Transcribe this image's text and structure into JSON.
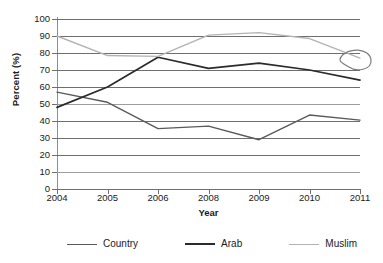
{
  "chart_data": {
    "type": "line",
    "title": "",
    "xlabel": "Year",
    "ylabel": "Percent (%)",
    "categories": [
      "2004",
      "2005",
      "2006",
      "2008",
      "2009",
      "2010",
      "2011"
    ],
    "ylim": [
      0,
      100
    ],
    "ytick_step": 10,
    "yticks": [
      "100",
      "90",
      "80",
      "70",
      "60",
      "50",
      "40",
      "30",
      "20",
      "10",
      "0"
    ],
    "grid": true,
    "legend_position": "bottom",
    "series": [
      {
        "name": "Country",
        "color": "#5a5a5a",
        "values": [
          57,
          51,
          35.5,
          37,
          29,
          43.5,
          40.5
        ]
      },
      {
        "name": "Arab",
        "color": "#2b2b2b",
        "values": [
          48,
          60,
          77.5,
          71,
          74,
          70,
          64
        ]
      },
      {
        "name": "Muslim",
        "color": "#b3b3b3",
        "values": [
          90,
          78.5,
          78,
          90.5,
          92,
          88.5,
          77
        ]
      }
    ],
    "annotations": [
      {
        "name": "hand-drawn-circle",
        "note": "",
        "color": "#7d7d7d",
        "x_category": "2011",
        "y_value": 77
      }
    ]
  },
  "legend": {
    "items": [
      {
        "label": "Country",
        "color": "#5a5a5a"
      },
      {
        "label": "Arab",
        "color": "#2b2b2b"
      },
      {
        "label": "Muslim",
        "color": "#b3b3b3"
      }
    ]
  }
}
